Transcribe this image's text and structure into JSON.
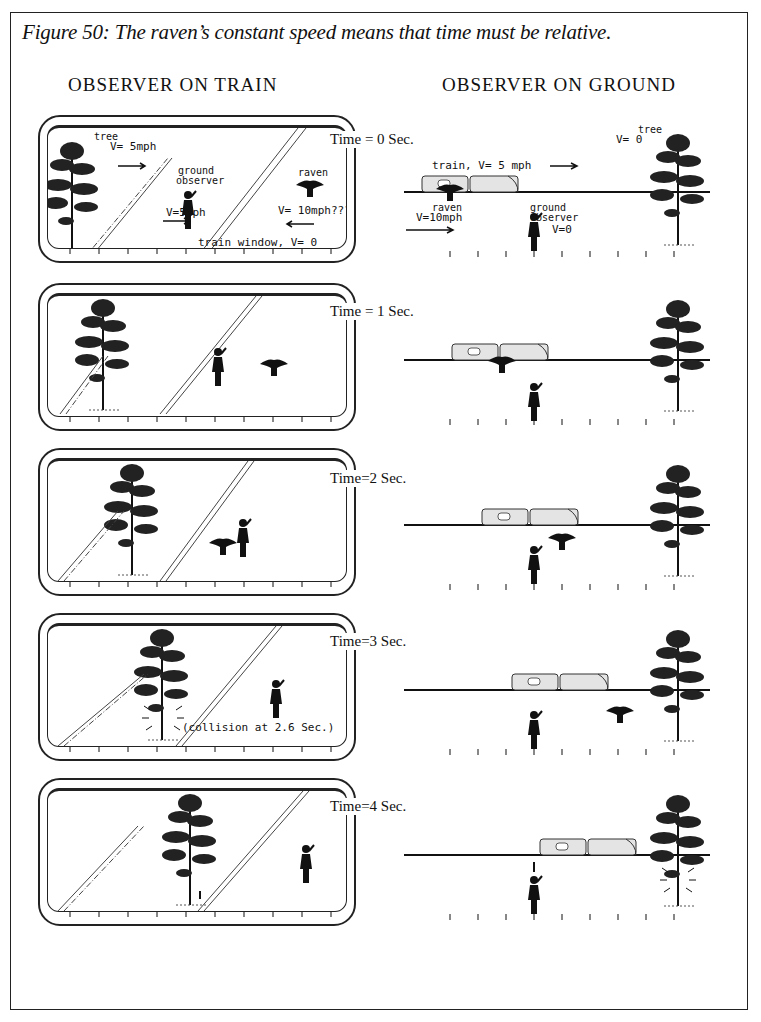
{
  "caption": "Figure 50: The raven’s constant speed means that time must be relative.",
  "columns": {
    "left": "OBSERVER ON TRAIN",
    "right": "OBSERVER ON GROUND"
  },
  "panels": [
    {
      "time": "Time = 0 Sec.",
      "train_view": {
        "labels": {
          "tree": "tree",
          "tree_v": "V= 5mph",
          "ground_observer": "ground observer",
          "ground_observer_v": "V=5mph",
          "raven": "raven",
          "raven_v": "V= 10mph???",
          "window": "train window, V= 0"
        }
      },
      "ground_view": {
        "labels": {
          "train": "train, V= 5 mph",
          "raven": "raven",
          "raven_v": "V=10mph",
          "ground_observer": "ground observer",
          "ground_observer_v": "V=0",
          "tree": "tree",
          "tree_v": "V= 0"
        }
      }
    },
    {
      "time": "Time = 1 Sec."
    },
    {
      "time": "Time=2 Sec."
    },
    {
      "time": "Time=3 Sec.",
      "train_view": {
        "labels": {
          "collision": "(collision at 2.6 Sec.)"
        }
      }
    },
    {
      "time": "Time=4 Sec."
    }
  ],
  "colors": {
    "ink": "#111111",
    "paper": "#ffffff",
    "train_fill": "#e4e4e4"
  }
}
